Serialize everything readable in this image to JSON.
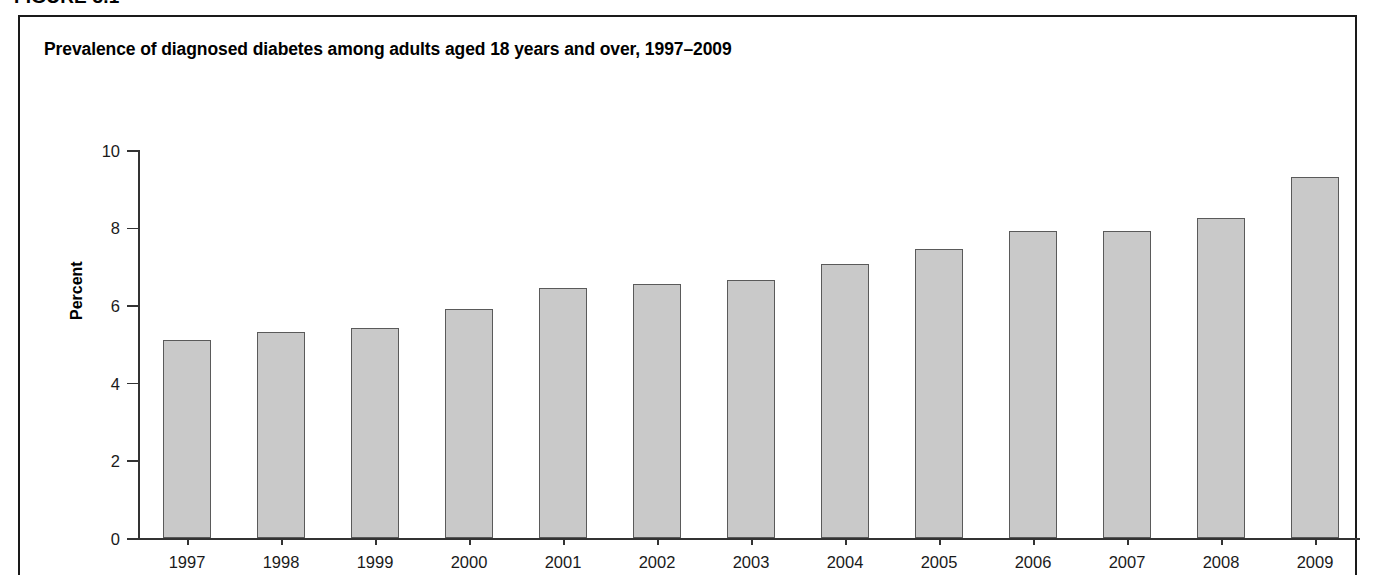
{
  "figure": {
    "label": "FIGURE 3.1"
  },
  "chart_data": {
    "type": "bar",
    "title": "Prevalence of diagnosed diabetes among adults aged 18 years and over, 1997–2009",
    "xlabel": "",
    "ylabel": "Percent",
    "categories": [
      "1997",
      "1998",
      "1999",
      "2000",
      "2001",
      "2002",
      "2003",
      "2004",
      "2005",
      "2006",
      "2007",
      "2008",
      "2009"
    ],
    "values": [
      5.1,
      5.3,
      5.4,
      5.9,
      6.45,
      6.55,
      6.65,
      7.05,
      7.45,
      7.9,
      7.9,
      8.25,
      9.3
    ],
    "ylim": [
      0,
      10
    ],
    "ytick_labels": [
      "0",
      "2",
      "4",
      "6",
      "8",
      "10"
    ],
    "ytick_values": [
      0,
      2,
      4,
      6,
      8,
      10
    ],
    "grid": false,
    "legend": false,
    "bar_fill_color": "#c9c9c9",
    "bar_border_color": "#5a5a5a",
    "axis_color": "#333333"
  }
}
